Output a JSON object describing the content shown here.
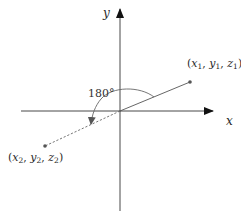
{
  "diagram": {
    "axes": {
      "x_label": "x",
      "y_label": "y"
    },
    "angle_label": "180°",
    "points": [
      {
        "name": "P1",
        "label_x": "x",
        "label_y": "y",
        "label_z": "z",
        "subscript": "1",
        "style": "solid"
      },
      {
        "name": "P2",
        "label_x": "x",
        "label_y": "y",
        "label_z": "z",
        "subscript": "2",
        "style": "dashed"
      }
    ],
    "punct": {
      "open": "(",
      "comma": ", ",
      "close": ")"
    },
    "colors": {
      "axis": "#333333",
      "line": "#555555",
      "point": "#555555",
      "text": "#2a2a2a"
    }
  }
}
